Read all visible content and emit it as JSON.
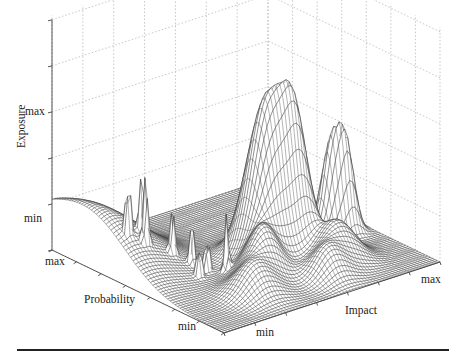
{
  "chart_data": {
    "type": "surface3d",
    "title": "",
    "axes": {
      "x": {
        "label": "Impact",
        "ticks": [
          "min",
          "max"
        ]
      },
      "y": {
        "label": "Probability",
        "ticks": [
          "max",
          "min"
        ]
      },
      "z": {
        "label": "Exposure",
        "ticks": [
          "min",
          "max"
        ]
      }
    },
    "grid": true,
    "grid_style": "dotted",
    "surface": {
      "style": "mesh",
      "color": "#333333",
      "baseline": "min",
      "features": [
        {
          "name": "main-peak",
          "impact": 0.55,
          "probability": 0.45,
          "height": 0.95
        },
        {
          "name": "second-peak",
          "impact": 0.65,
          "probability": 0.42,
          "height": 0.75
        },
        {
          "name": "right-twin-peak-a",
          "impact": 0.85,
          "probability": 0.45,
          "height": 0.55
        },
        {
          "name": "right-twin-peak-b",
          "impact": 0.9,
          "probability": 0.42,
          "height": 0.5
        },
        {
          "name": "spike-cluster",
          "impact": 0.3,
          "probability": 0.6,
          "height": 0.6
        },
        {
          "name": "left-ridge",
          "impact": 0.05,
          "probability": 0.9,
          "height": 0.35
        }
      ]
    },
    "legend": null
  },
  "labels": {
    "z_axis": "Exposure",
    "z_max": "max",
    "z_min": "min",
    "y_axis": "Probability",
    "y_max": "max",
    "y_min": "min",
    "x_axis": "Impact",
    "x_min": "min",
    "x_max": "max"
  },
  "colors": {
    "mesh": "#333333",
    "grid": "#b5b5b5",
    "axis": "#444444",
    "rule": "#222222"
  }
}
